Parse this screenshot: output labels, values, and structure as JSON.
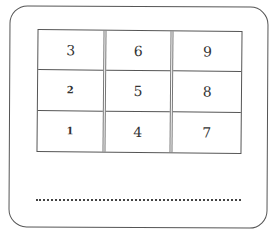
{
  "diagram": {
    "columns": [
      {
        "cells": [
          "3",
          "2",
          "1"
        ]
      },
      {
        "cells": [
          "6",
          "5",
          "4"
        ]
      },
      {
        "cells": [
          "9",
          "8",
          "7"
        ]
      }
    ],
    "answer_line": "dotted",
    "caption": "Fig."
  }
}
